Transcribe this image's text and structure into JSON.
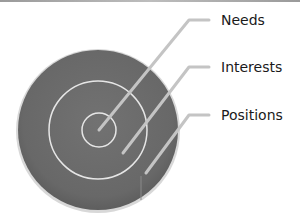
{
  "diagram": {
    "title": "",
    "layers": [
      {
        "label": "Needs",
        "description": "inner circle"
      },
      {
        "label": "Interests",
        "description": "middle ring"
      },
      {
        "label": "Positions",
        "description": "outer ring"
      }
    ],
    "colors": {
      "disc_fill": "#6b6b6b",
      "ring_stroke": "#e6e6e6",
      "leader_line": "#c4c4c4",
      "label_text": "#1a1a1a"
    }
  }
}
